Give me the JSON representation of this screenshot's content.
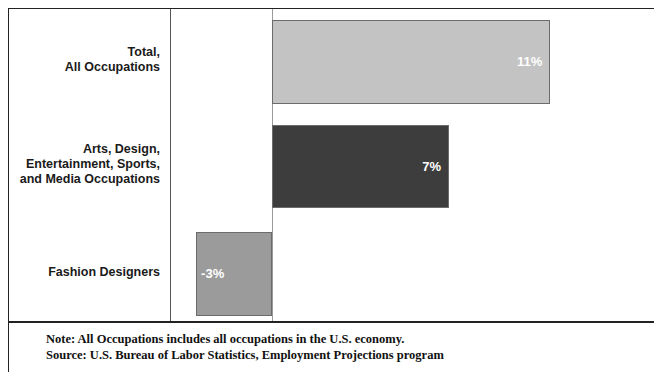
{
  "chart_data": {
    "type": "bar",
    "orientation": "horizontal",
    "title": "",
    "subtitle": "",
    "xlabel": "",
    "ylabel": "",
    "categories": [
      "Total,\nAll Occupations",
      "Arts, Design,\nEntertainment, Sports,\nand Media Occupations",
      "Fashion Designers"
    ],
    "values": [
      11,
      7,
      -3
    ],
    "value_labels": [
      "11%",
      "7%",
      "-3%"
    ],
    "bar_colors": [
      "#c3c3c3",
      "#3d3d3d",
      "#9b9b9b"
    ],
    "bar_border_color": "#6b6b6b",
    "value_label_color": "#ffffff",
    "xlim": [
      -3,
      11
    ],
    "zero_line": 0,
    "grid": false,
    "legend": "none",
    "axis_line_color": "#9a9a9a"
  },
  "notes": {
    "note_line": "Note: All Occupations includes all occupations in the U.S. economy.",
    "source_line": "Source: U.S. Bureau of Labor Statistics, Employment Projections program"
  }
}
